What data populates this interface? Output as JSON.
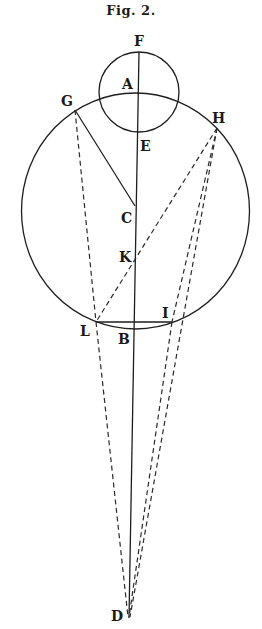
{
  "figure": {
    "title": "Fig. 2.",
    "labels": {
      "F": "F",
      "A": "A",
      "G": "G",
      "H": "H",
      "E": "E",
      "C": "C",
      "K": "K",
      "L": "L",
      "I": "I",
      "B": "B",
      "D": "D"
    },
    "points": {
      "F": [
        139,
        52
      ],
      "A": [
        138,
        92
      ],
      "E": [
        138,
        132
      ],
      "G": [
        75,
        110
      ],
      "H": [
        217,
        128
      ],
      "C": [
        135,
        206
      ],
      "K": [
        134,
        261
      ],
      "L": [
        96,
        322
      ],
      "I": [
        172,
        322
      ],
      "B": [
        133,
        329
      ],
      "D": [
        129,
        618
      ]
    },
    "circles": [
      {
        "name": "small-circle",
        "center": [
          139,
          92
        ],
        "r": 40
      },
      {
        "name": "large-circle",
        "center": [
          135,
          211
        ],
        "rx": 114,
        "ry": 118
      }
    ],
    "segments_solid": [
      "F-D",
      "G-C",
      "L-I"
    ],
    "segments_dashed": [
      "G-L",
      "L-D",
      "H-L",
      "H-I",
      "I-D",
      "H-D"
    ]
  }
}
